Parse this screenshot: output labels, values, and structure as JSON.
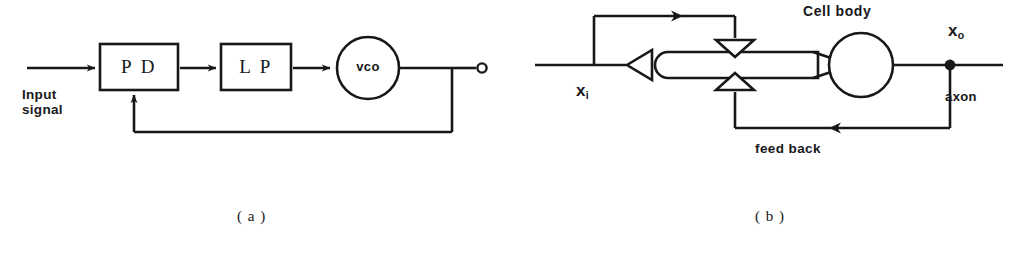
{
  "figure": {
    "background_color": "#ffffff",
    "ink_color": "#18181a",
    "width": 1026,
    "height": 254
  },
  "panel_a": {
    "caption": "( a )",
    "name": "phase-locked-loop-block-diagram",
    "input_label_line1": "Input",
    "input_label_line2": "signal",
    "blocks": [
      {
        "id": "pd",
        "label": "P D"
      },
      {
        "id": "lp",
        "label": "L P"
      },
      {
        "id": "vco",
        "label": "vco"
      }
    ],
    "output_terminal": "open-circle"
  },
  "panel_b": {
    "caption": "( b )",
    "name": "neuron-feedback-diagram",
    "cell_body_label": "Cell  body",
    "input_label": "x",
    "input_subscript": "i",
    "output_label": "x",
    "output_subscript": "o",
    "axon_label": "axon",
    "feedback_label": "feed back",
    "synapse_count": 2
  }
}
